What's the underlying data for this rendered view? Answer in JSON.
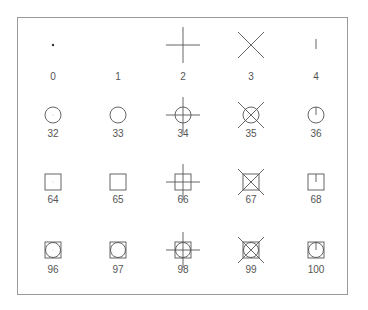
{
  "figure": {
    "type": "symbol-reference-grid",
    "frame_color": "#9a9a9a",
    "stroke_color": "#555555",
    "columns_x": [
      53,
      118,
      183,
      251,
      316
    ],
    "rows": [
      {
        "symbol_y": 45,
        "label_y": 77,
        "items": [
          {
            "code": "0",
            "shape": "dot"
          },
          {
            "code": "1",
            "shape": "invisible-point"
          },
          {
            "code": "2",
            "shape": "plus"
          },
          {
            "code": "3",
            "shape": "cross"
          },
          {
            "code": "4",
            "shape": "tick"
          }
        ]
      },
      {
        "symbol_y": 115,
        "label_y": 134,
        "items": [
          {
            "code": "32",
            "shape": "circle-dot"
          },
          {
            "code": "33",
            "shape": "circle"
          },
          {
            "code": "34",
            "shape": "circle-plus"
          },
          {
            "code": "35",
            "shape": "circle-cross"
          },
          {
            "code": "36",
            "shape": "circle-tick"
          }
        ]
      },
      {
        "symbol_y": 182,
        "label_y": 200,
        "items": [
          {
            "code": "64",
            "shape": "square-dot"
          },
          {
            "code": "65",
            "shape": "square"
          },
          {
            "code": "66",
            "shape": "square-plus"
          },
          {
            "code": "67",
            "shape": "square-cross"
          },
          {
            "code": "68",
            "shape": "square-tick"
          }
        ]
      },
      {
        "symbol_y": 250,
        "label_y": 270,
        "items": [
          {
            "code": "96",
            "shape": "square-circle-dot"
          },
          {
            "code": "97",
            "shape": "square-circle"
          },
          {
            "code": "98",
            "shape": "square-circle-plus"
          },
          {
            "code": "99",
            "shape": "square-circle-cross"
          },
          {
            "code": "100",
            "shape": "square-circle-tick"
          }
        ]
      }
    ]
  }
}
